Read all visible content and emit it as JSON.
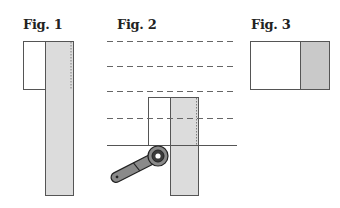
{
  "figures": [
    {
      "id": "fig1",
      "label": "Fig. 1"
    },
    {
      "id": "fig2",
      "label": "Fig. 2"
    },
    {
      "id": "fig3",
      "label": "Fig. 3"
    }
  ],
  "colors": {
    "fabric_fill": "#dcdcdc",
    "fabric_fill_dark": "#c9c9c9",
    "outline": "#555555",
    "dashed": "#666666",
    "cutter_handle": "#8a8a8a",
    "cutter_wheel": "#3a3a3a"
  }
}
